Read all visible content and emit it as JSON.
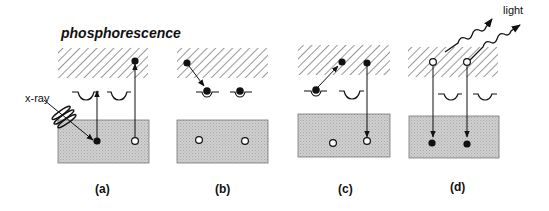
{
  "diagram": {
    "title": "phosphorescence",
    "labels": {
      "xray": "x-ray",
      "light": "light"
    },
    "panels": [
      {
        "id": "a",
        "caption": "(a)"
      },
      {
        "id": "b",
        "caption": "(b)"
      },
      {
        "id": "c",
        "caption": "(c)"
      },
      {
        "id": "d",
        "caption": "(d)"
      }
    ],
    "legend_semantics": {
      "hatched_box": "conduction band",
      "gray_box": "valence band",
      "trap_wells": "trap states",
      "filled_dot": "electron",
      "open_circle": "hole"
    },
    "colors": {
      "gray_box": "#c8c8c8",
      "hatch": "#444444",
      "ink": "#111111"
    }
  }
}
